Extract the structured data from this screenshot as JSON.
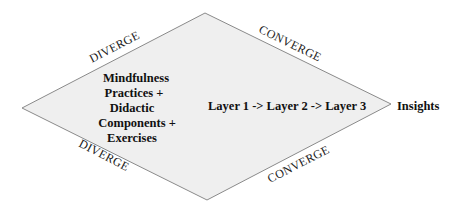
{
  "diagram": {
    "type": "diverge-converge diamond",
    "colors": {
      "fill": "#efefef",
      "stroke": "#8a8a8a",
      "text": "#111111"
    },
    "edge_labels": {
      "top_left": "DIVERGE",
      "top_right": "CONVERGE",
      "bottom_left": "DIVERGE",
      "bottom_right": "CONVERGE"
    },
    "left_block": {
      "lines": [
        "Mindfulness",
        "Practices +",
        "Didactic",
        "Components +",
        "Exercises"
      ]
    },
    "center_flow": "Layer 1 -> Layer 2 -> Layer 3",
    "output_label": "Insights"
  }
}
